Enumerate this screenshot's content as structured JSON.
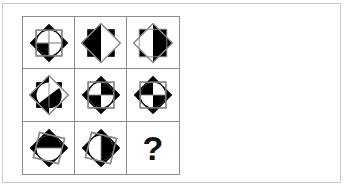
{
  "panel": {
    "border_color": "#c9c9c9",
    "background": "#ffffff"
  },
  "matrix": {
    "type": "progressive-matrix",
    "rows": 3,
    "columns": 3,
    "grid_line_color": "#8c8c8c",
    "fill_color": "#000000",
    "outline_color": "#8c8c8c",
    "circle_color": "#000000",
    "missing_cell_index": 8,
    "missing_cell_label": "?",
    "cells": [
      {
        "index": 0,
        "position": "row1-col1",
        "description": "octagram with inscribed quartered circle, bottom-left quadrant black",
        "square_rotation_deg": 0,
        "diamond_rotation_deg": 45,
        "shaded_parts": [
          "bottom-left-quadrant"
        ],
        "has_cross_lines": true
      },
      {
        "index": 1,
        "position": "row1-col2",
        "description": "octagram, left half and upper-left region black",
        "square_rotation_deg": 0,
        "diamond_rotation_deg": 45,
        "shaded_parts": [
          "top-left-quadrant",
          "bottom-left-quadrant"
        ],
        "has_cross_lines": false
      },
      {
        "index": 2,
        "position": "row1-col3",
        "description": "octagram, right side black wedge",
        "square_rotation_deg": 0,
        "diamond_rotation_deg": 45,
        "shaded_parts": [
          "top-right-quadrant",
          "bottom-left-quadrant"
        ],
        "has_cross_lines": false
      },
      {
        "index": 3,
        "position": "row2-col1",
        "description": "octagram, left half black with diagonal split",
        "square_rotation_deg": 0,
        "diamond_rotation_deg": 45,
        "shaded_parts": [
          "left-half",
          "bottom-right-quadrant"
        ],
        "has_cross_lines": false
      },
      {
        "index": 4,
        "position": "row2-col2",
        "description": "octagram, horizontal split with right-upper and left-lower black",
        "square_rotation_deg": 0,
        "diamond_rotation_deg": 45,
        "shaded_parts": [
          "top-right-quadrant",
          "bottom-left-quadrant"
        ],
        "has_cross_lines": false
      },
      {
        "index": 5,
        "position": "row2-col3",
        "description": "octagram, upper-left and lower-right black",
        "square_rotation_deg": 0,
        "diamond_rotation_deg": 45,
        "shaded_parts": [
          "top-left-quadrant",
          "bottom-right-quadrant"
        ],
        "has_cross_lines": false
      },
      {
        "index": 6,
        "position": "row3-col1",
        "description": "octagram, upper-left black wedge, rotated square",
        "square_rotation_deg": 15,
        "diamond_rotation_deg": 45,
        "shaded_parts": [
          "top-left-quadrant",
          "left-wedge"
        ],
        "has_cross_lines": false
      },
      {
        "index": 7,
        "position": "row3-col2",
        "description": "octagram, vertical split with right half black",
        "square_rotation_deg": 15,
        "diamond_rotation_deg": 45,
        "shaded_parts": [
          "top-left-quadrant",
          "right-half"
        ],
        "has_cross_lines": true
      },
      {
        "index": 8,
        "position": "row3-col3",
        "description": "missing answer cell showing a question mark",
        "shaded_parts": [],
        "has_cross_lines": false,
        "is_missing": true
      }
    ]
  }
}
